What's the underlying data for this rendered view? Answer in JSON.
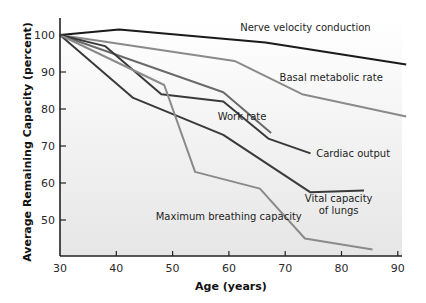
{
  "chart_data": {
    "type": "line",
    "title": "",
    "xlabel": "Age (years)",
    "ylabel": "Average Remaining Capacity (percent)",
    "xlim": [
      30,
      92
    ],
    "ylim": [
      40,
      105
    ],
    "xticks": [
      30,
      40,
      50,
      60,
      70,
      80,
      90
    ],
    "yticks": [
      50,
      60,
      70,
      80,
      90,
      100
    ],
    "grid": false,
    "legend": "inline labels",
    "series": [
      {
        "name": "Nerve velocity conduction",
        "color": "#1a1a1a",
        "points": [
          [
            30,
            100
          ],
          [
            40.5,
            101.5
          ],
          [
            66.5,
            98
          ],
          [
            91.5,
            92
          ]
        ],
        "label": {
          "text": "Nerve velocity conduction",
          "x": 62,
          "y": 101
        }
      },
      {
        "name": "Basal metabolic rate",
        "color": "#8a8a8a",
        "points": [
          [
            30,
            100
          ],
          [
            61,
            93
          ],
          [
            73,
            84
          ],
          [
            91.5,
            78
          ]
        ],
        "label": {
          "text": "Basal metabolic rate",
          "x": 69,
          "y": 87.5
        }
      },
      {
        "name": "Work rate",
        "color": "#6a6a6a",
        "points": [
          [
            30,
            100
          ],
          [
            59,
            84.5
          ],
          [
            67.5,
            73.5
          ]
        ],
        "label": {
          "text": "Work rate",
          "x": 58,
          "y": 77
        }
      },
      {
        "name": "Cardiac output",
        "color": "#3a3a3a",
        "points": [
          [
            30,
            100
          ],
          [
            38,
            97
          ],
          [
            48,
            84
          ],
          [
            59,
            82
          ],
          [
            67,
            72
          ],
          [
            74.5,
            68
          ]
        ],
        "label": {
          "text": "Cardiac output",
          "x": 75.5,
          "y": 67
        }
      },
      {
        "name": "Vital capacity of lungs",
        "color": "#3a3a3a",
        "points": [
          [
            30,
            100
          ],
          [
            43,
            83
          ],
          [
            59,
            73
          ],
          [
            74.5,
            57.5
          ],
          [
            84,
            58
          ]
        ],
        "label": {
          "text": "Vital capacity",
          "text2": "of lungs",
          "x": 79.5,
          "y": 55
        }
      },
      {
        "name": "Maximum breathing capacity",
        "color": "#8a8a8a",
        "points": [
          [
            30,
            100
          ],
          [
            48.5,
            86.5
          ],
          [
            54,
            63
          ],
          [
            65.5,
            58.5
          ],
          [
            73.5,
            45
          ],
          [
            85.5,
            42
          ]
        ],
        "label": {
          "text": "Maximum breathing capacity",
          "x": 47,
          "y": 50
        }
      }
    ]
  }
}
